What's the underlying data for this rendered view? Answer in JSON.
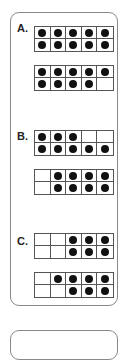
{
  "problems": [
    {
      "label": "A.",
      "frames": [
        [
          1,
          1,
          1,
          1,
          1,
          1,
          1,
          1,
          1,
          1
        ],
        [
          1,
          1,
          1,
          1,
          1,
          1,
          1,
          1,
          1,
          0
        ]
      ]
    },
    {
      "label": "B.",
      "frames": [
        [
          1,
          1,
          1,
          0,
          0,
          1,
          1,
          1,
          1,
          1
        ],
        [
          0,
          1,
          1,
          1,
          1,
          0,
          1,
          1,
          1,
          1
        ]
      ]
    },
    {
      "label": "C.",
      "frames": [
        [
          0,
          0,
          1,
          1,
          1,
          0,
          0,
          1,
          1,
          1
        ],
        [
          0,
          1,
          1,
          1,
          1,
          0,
          0,
          1,
          1,
          1
        ]
      ]
    }
  ]
}
